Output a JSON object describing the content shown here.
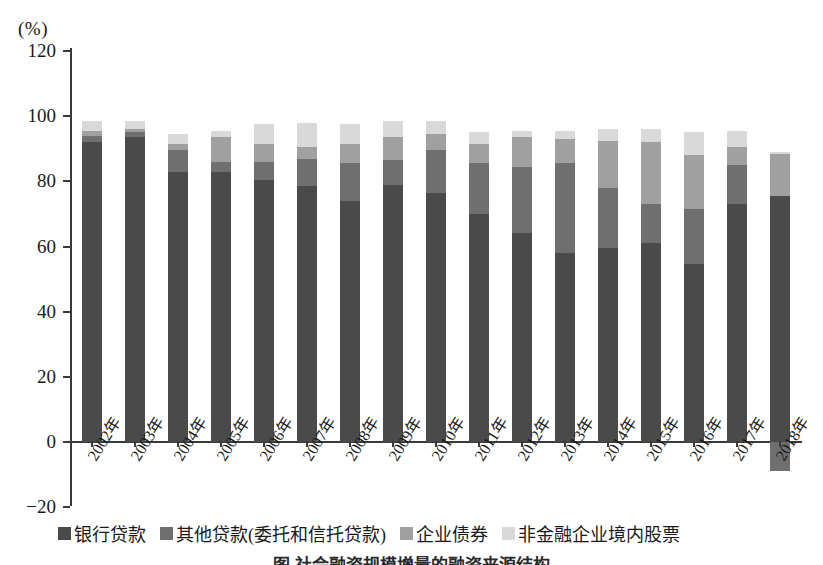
{
  "chart_data": {
    "type": "bar",
    "subtype": "stacked-bar",
    "title": "",
    "unit_label": "(%)",
    "xlabel": "",
    "ylabel": "",
    "ylim": [
      -20,
      120
    ],
    "yticks": [
      120,
      100,
      80,
      60,
      40,
      20,
      0,
      -20
    ],
    "grid": false,
    "legend_position": "bottom",
    "categories": [
      "2002年",
      "2003年",
      "2004年",
      "2005年",
      "2006年",
      "2007年",
      "2008年",
      "2009年",
      "2010年",
      "2011年",
      "2012年",
      "2013年",
      "2014年",
      "2015年",
      "2016年",
      "2017年",
      "2018年"
    ],
    "series": [
      {
        "name": "银行贷款",
        "color": "#4a4a4a",
        "values": [
          92.0,
          93.5,
          83.0,
          83.0,
          80.5,
          78.5,
          74.0,
          79.0,
          76.5,
          70.0,
          64.0,
          58.0,
          59.5,
          61.0,
          54.5,
          73.0,
          75.5
        ]
      },
      {
        "name": "其他贷款(委托和信托贷款)",
        "color": "#6f6f6f",
        "values": [
          2.0,
          1.5,
          6.5,
          3.0,
          5.5,
          8.5,
          11.5,
          7.5,
          13.0,
          15.5,
          20.5,
          27.5,
          18.5,
          12.0,
          17.0,
          12.0,
          -9.0
        ]
      },
      {
        "name": "企业债券",
        "color": "#a0a0a0",
        "values": [
          1.5,
          1.0,
          2.0,
          7.5,
          5.5,
          3.5,
          6.0,
          7.0,
          5.0,
          6.0,
          9.0,
          7.5,
          14.5,
          19.0,
          16.5,
          5.5,
          13.0
        ]
      },
      {
        "name": "非金融企业境内股票",
        "color": "#d9d9d9",
        "values": [
          3.0,
          2.5,
          3.0,
          2.0,
          6.0,
          7.5,
          6.0,
          5.0,
          4.0,
          3.5,
          2.0,
          2.5,
          3.5,
          4.0,
          7.0,
          5.0,
          0.5
        ]
      }
    ]
  },
  "legend": {
    "items": [
      {
        "label": "银行贷款",
        "color": "#4a4a4a"
      },
      {
        "label": "其他贷款(委托和信托贷款)",
        "color": "#6f6f6f"
      },
      {
        "label": "企业债券",
        "color": "#a0a0a0"
      },
      {
        "label": "非金融企业境内股票",
        "color": "#d9d9d9"
      }
    ]
  },
  "caption": {
    "text": "图 社会融资规模增量的融资来源结构"
  }
}
